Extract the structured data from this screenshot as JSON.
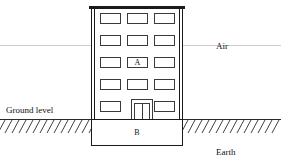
{
  "diagram": {
    "labels": {
      "air": "Air",
      "earth": "Earth",
      "ground_level": "Ground level",
      "above_ground_structure": "A",
      "below_ground_structure": "B"
    },
    "colors": {
      "outline": "#1a1a1a",
      "window_outline": "#3a3a3a",
      "ground_line": "#2b2b2b",
      "air_line": "#cfcfcf",
      "background": "#ffffff"
    },
    "building": {
      "floors": 5,
      "columns": 3,
      "windows": [
        {
          "id": "w-r1-c1",
          "label": ""
        },
        {
          "id": "w-r1-c2",
          "label": ""
        },
        {
          "id": "w-r1-c3",
          "label": ""
        },
        {
          "id": "w-r2-c1",
          "label": ""
        },
        {
          "id": "w-r2-c2",
          "label": ""
        },
        {
          "id": "w-r2-c3",
          "label": ""
        },
        {
          "id": "w-r3-c1",
          "label": ""
        },
        {
          "id": "w-r3-c2",
          "label": "A"
        },
        {
          "id": "w-r3-c3",
          "label": ""
        },
        {
          "id": "w-r4-c1",
          "label": ""
        },
        {
          "id": "w-r4-c2",
          "label": ""
        },
        {
          "id": "w-r4-c3",
          "label": ""
        },
        {
          "id": "w-r5-c1",
          "label": ""
        },
        {
          "id": "w-r5-c3",
          "label": ""
        }
      ],
      "door": {
        "type": "double-door",
        "label": ""
      }
    },
    "basement": {
      "label": "B"
    }
  }
}
